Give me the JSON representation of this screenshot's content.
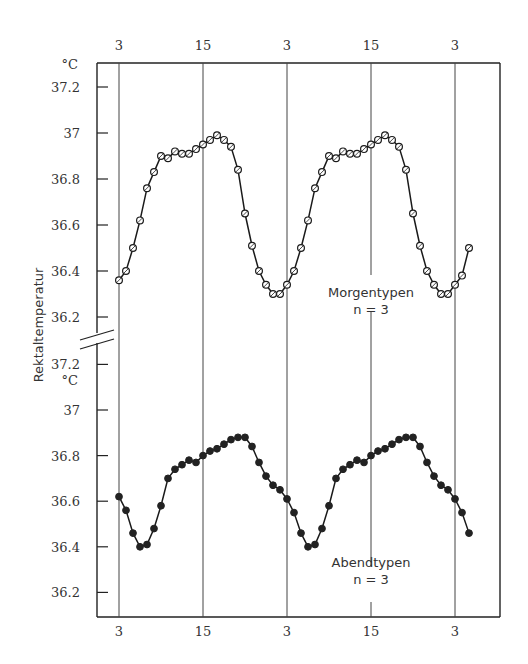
{
  "chart_data": [
    {
      "panel": "top",
      "type": "line",
      "title": "",
      "ylabel": "Rektaltemperatur",
      "yunit": "°C",
      "xlabel": "",
      "x_ticks": [
        "3",
        "15",
        "3",
        "15",
        "3"
      ],
      "x_ticks_position": "top",
      "y_ticks": [
        "37.2",
        "37",
        "36.8",
        "36.6",
        "36.4",
        "36.2"
      ],
      "ylim": [
        36.1,
        37.25
      ],
      "annotation": {
        "line1": "Morgentypen",
        "line2": "n = 3"
      },
      "marker": "open-circle",
      "series": [
        {
          "name": "Morgentypen",
          "x": [
            3,
            4,
            5,
            6,
            7,
            8,
            9,
            10,
            11,
            12,
            13,
            14,
            15,
            16,
            17,
            18,
            19,
            20,
            21,
            22,
            23,
            24,
            25,
            26,
            27,
            28,
            29,
            30,
            31,
            32,
            33,
            34,
            35,
            36,
            37,
            38,
            39,
            40,
            41,
            42,
            43,
            44,
            45,
            46,
            47,
            48,
            49,
            50,
            51,
            52,
            53
          ],
          "values": [
            36.36,
            36.4,
            36.5,
            36.62,
            36.76,
            36.83,
            36.9,
            36.89,
            36.92,
            36.91,
            36.91,
            36.93,
            36.95,
            36.97,
            36.99,
            36.97,
            36.94,
            36.84,
            36.65,
            36.51,
            36.4,
            36.34,
            36.3,
            36.3,
            36.34,
            36.4,
            36.5,
            36.62,
            36.76,
            36.83,
            36.9,
            36.89,
            36.92,
            36.91,
            36.91,
            36.93,
            36.95,
            36.97,
            36.99,
            36.97,
            36.94,
            36.84,
            36.65,
            36.51,
            36.4,
            36.34,
            36.3,
            36.3,
            36.34,
            36.38,
            36.5
          ]
        }
      ]
    },
    {
      "panel": "bottom",
      "type": "line",
      "title": "",
      "ylabel": "Rektaltemperatur",
      "yunit": "°C",
      "xlabel": "",
      "x_ticks": [
        "3",
        "15",
        "3",
        "15",
        "3"
      ],
      "x_ticks_position": "bottom",
      "y_ticks": [
        "37.2",
        "37",
        "36.8",
        "36.6",
        "36.4",
        "36.2"
      ],
      "ylim": [
        36.1,
        37.25
      ],
      "annotation": {
        "line1": "Abendtypen",
        "line2": "n = 3"
      },
      "marker": "filled-circle",
      "series": [
        {
          "name": "Abendtypen",
          "x": [
            3,
            4,
            5,
            6,
            7,
            8,
            9,
            10,
            11,
            12,
            13,
            14,
            15,
            16,
            17,
            18,
            19,
            20,
            21,
            22,
            23,
            24,
            25,
            26,
            27,
            28,
            29,
            30,
            31,
            32,
            33,
            34,
            35,
            36,
            37,
            38,
            39,
            40,
            41,
            42,
            43,
            44,
            45,
            46,
            47,
            48,
            49,
            50,
            51,
            52,
            53
          ],
          "values": [
            36.62,
            36.56,
            36.46,
            36.4,
            36.41,
            36.48,
            36.58,
            36.7,
            36.74,
            36.76,
            36.78,
            36.77,
            36.8,
            36.82,
            36.83,
            36.85,
            36.87,
            36.88,
            36.88,
            36.84,
            36.77,
            36.71,
            36.67,
            36.65,
            36.61,
            36.55,
            36.46,
            36.4,
            36.41,
            36.48,
            36.58,
            36.7,
            36.74,
            36.76,
            36.78,
            36.77,
            36.8,
            36.82,
            36.83,
            36.85,
            36.87,
            36.88,
            36.88,
            36.84,
            36.77,
            36.71,
            36.67,
            36.65,
            36.61,
            36.55,
            36.46
          ]
        }
      ]
    }
  ],
  "labels": {
    "y_axis_title": "Rektaltemperatur",
    "unit_top": "°C",
    "unit_bottom": "°C",
    "top_annotation_line1": "Morgentypen",
    "top_annotation_line2": "n = 3",
    "bottom_annotation_line1": "Abendtypen",
    "bottom_annotation_line2": "n = 3",
    "top_x_ticks": [
      "3",
      "15",
      "3",
      "15",
      "3"
    ],
    "bottom_x_ticks": [
      "3",
      "15",
      "3",
      "15",
      "3"
    ],
    "top_y_ticks": [
      "37.2",
      "37",
      "36.8",
      "36.6",
      "36.4",
      "36.2"
    ],
    "bottom_y_ticks": [
      "37.2",
      "37",
      "36.8",
      "36.6",
      "36.4",
      "36.2"
    ]
  }
}
